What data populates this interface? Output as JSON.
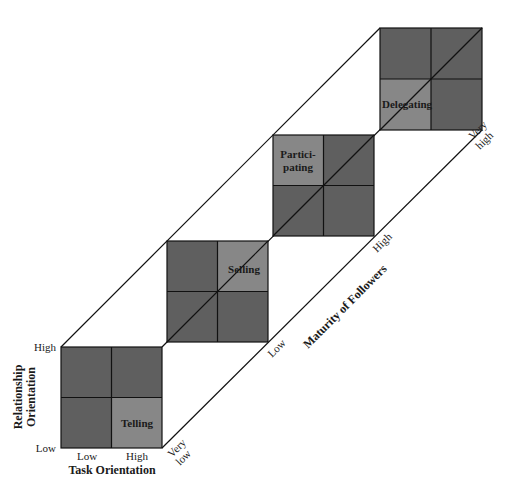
{
  "diagram": {
    "type": "situational-leadership-model",
    "colors": {
      "dark_cell": "#5f5f5f",
      "light_cell": "#878787",
      "line": "#111111",
      "background": "#ffffff"
    },
    "x_axis": {
      "title": "Task Orientation",
      "ticks": [
        "Low",
        "High"
      ]
    },
    "y_axis": {
      "title_line1": "Relationship",
      "title_line2": "Orientation",
      "ticks": [
        "High",
        "Low"
      ]
    },
    "depth_axis": {
      "title": "Maturity of Followers",
      "ticks": [
        {
          "line1": "Very",
          "line2": "low"
        },
        {
          "line1": "Low",
          "line2": ""
        },
        {
          "line1": "High",
          "line2": ""
        },
        {
          "line1": "Very",
          "line2": "high"
        }
      ]
    },
    "styles": [
      {
        "label": "Telling",
        "highlight": "bottom-right"
      },
      {
        "label": "Selling",
        "highlight": "top-right"
      },
      {
        "label_line1": "Partici-",
        "label_line2": "pating",
        "highlight": "top-left"
      },
      {
        "label": "Delegating",
        "highlight": "bottom-left"
      }
    ]
  }
}
